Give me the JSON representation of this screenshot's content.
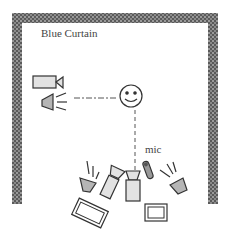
{
  "diagram": {
    "curtain_label": "Blue Curtain",
    "mic_label": "mic",
    "elements": [
      {
        "name": "blue-curtain",
        "shape": "U-shaped hatched wall"
      },
      {
        "name": "side-camera",
        "shape": "video camera"
      },
      {
        "name": "side-light",
        "shape": "spotlight"
      },
      {
        "name": "subject",
        "shape": "smiley face"
      },
      {
        "name": "front-light-left",
        "shape": "spotlight"
      },
      {
        "name": "front-camera-left",
        "shape": "video camera (angled)"
      },
      {
        "name": "front-camera-center",
        "shape": "video camera"
      },
      {
        "name": "microphone",
        "shape": "mic"
      },
      {
        "name": "front-light-right",
        "shape": "spotlight"
      },
      {
        "name": "monitor-left",
        "shape": "monitor (angled)"
      },
      {
        "name": "monitor-right",
        "shape": "monitor"
      }
    ],
    "colors": {
      "curtain": "#6a6a6a",
      "fill_light": "#e2e2e2",
      "fill_dark": "#b5b5b5",
      "stroke": "#333333"
    }
  }
}
